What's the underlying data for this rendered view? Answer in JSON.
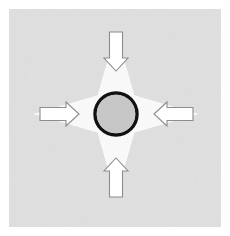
{
  "figure": {
    "canvas": {
      "width": 230,
      "height": 236
    },
    "background_color": "#ffffff",
    "panel": {
      "name": "gray-noise-panel",
      "x": 9,
      "y": 9,
      "width": 212,
      "height": 218,
      "fill_color": "#e2e2e2",
      "texture": "speckled-noise"
    },
    "star": {
      "name": "four-point-concave-star",
      "fill_color": "#fbfbfb",
      "points": 4,
      "center_x": 116,
      "center_y": 114,
      "outer_radius": 82,
      "inner_radius": 26,
      "tip_directions": [
        "top-left",
        "top-right",
        "bottom-right",
        "bottom-left"
      ]
    },
    "circle": {
      "name": "center-disc",
      "center_x": 116,
      "center_y": 114,
      "radius": 21,
      "fill_color": "#c8c8c8",
      "stroke_color": "#111111",
      "stroke_width": 3.4
    },
    "arrows": [
      {
        "id": "arrow-top",
        "name": "arrow-down",
        "direction": "down",
        "label": "down",
        "fill_color": "#ffffff",
        "stroke_color": "#8c8c8c",
        "stroke_width": 1.1,
        "shaft_length": 26,
        "shaft_width": 13,
        "head_width": 24,
        "head_length": 13,
        "tip_x": 116,
        "tip_y": 71
      },
      {
        "id": "arrow-left",
        "name": "arrow-right",
        "direction": "right",
        "label": "right",
        "fill_color": "#ffffff",
        "stroke_color": "#8c8c8c",
        "stroke_width": 1.1,
        "shaft_length": 26,
        "shaft_width": 13,
        "head_width": 24,
        "head_length": 13,
        "tip_x": 79,
        "tip_y": 114
      },
      {
        "id": "arrow-right",
        "name": "arrow-left",
        "direction": "left",
        "label": "left",
        "fill_color": "#ffffff",
        "stroke_color": "#8c8c8c",
        "stroke_width": 1.1,
        "shaft_length": 26,
        "shaft_width": 13,
        "head_width": 24,
        "head_length": 13,
        "tip_x": 154,
        "tip_y": 114
      },
      {
        "id": "arrow-bottom",
        "name": "arrow-up",
        "direction": "up",
        "label": "up",
        "fill_color": "#ffffff",
        "stroke_color": "#8c8c8c",
        "stroke_width": 1.1,
        "shaft_length": 26,
        "shaft_width": 13,
        "head_width": 24,
        "head_length": 13,
        "tip_x": 116,
        "tip_y": 158
      }
    ]
  }
}
